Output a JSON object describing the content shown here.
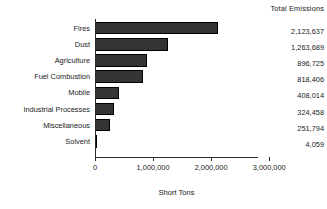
{
  "chart_data": {
    "type": "bar",
    "orientation": "horizontal",
    "title": "",
    "xlabel": "Short Tons",
    "ylabel": "",
    "categories": [
      "Fires",
      "Dust",
      "Agriculture",
      "Fuel Combustion",
      "Mobile",
      "Industrial Processes",
      "Miscellaneous",
      "Solvent"
    ],
    "values": [
      2123637,
      1263689,
      896725,
      818406,
      408014,
      324458,
      251794,
      4059
    ],
    "value_labels": [
      "2,123,637",
      "1,263,689",
      "896,725",
      "818,406",
      "408,014",
      "324,458",
      "251,794",
      "4,059"
    ],
    "xlim": [
      0,
      3100000
    ],
    "xticks": [
      0,
      1000000,
      2000000,
      3000000
    ],
    "xtick_labels": [
      "0",
      "1,000,000",
      "2,000,000",
      "3,000,000"
    ],
    "grid": false,
    "legend": false,
    "bar_color": "#343434",
    "bar_edge_color": "#000000",
    "axis_color": "#2b2b2b",
    "background_color": "#ffffff"
  },
  "value_column": {
    "header": "Total Emissions"
  }
}
